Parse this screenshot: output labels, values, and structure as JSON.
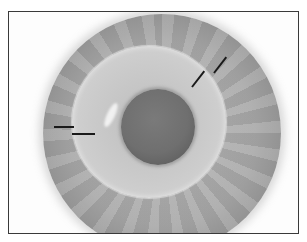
{
  "image": {
    "description": "Grayscale clinical photograph of a contact lens centered on an eye, showing iris, lens edge and pupil, framed with a thin dark border",
    "annotations": [
      {
        "type": "line-marker",
        "location": "left",
        "count": 2,
        "target": "lens edge"
      },
      {
        "type": "line-marker",
        "location": "upper-right",
        "count": 2,
        "target": "lens edge"
      }
    ],
    "colors": {
      "frame_border": "#3a3a3a",
      "iris": "#a8a8a8",
      "lens": "#cbcbcb",
      "pupil": "#6a6a6a",
      "marker": "#1a1a1a"
    }
  }
}
